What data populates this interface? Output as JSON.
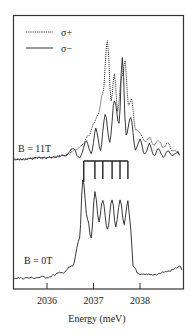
{
  "chart_data": {
    "type": "line",
    "title": "",
    "xlabel": "Energy (meV)",
    "ylabel": "",
    "xlim": [
      2035.27,
      2038.95
    ],
    "x_ticks": [
      2036,
      2037,
      2038
    ],
    "x_tick_labels": [
      "2036",
      "2037",
      "2038"
    ],
    "grid": false,
    "legend": {
      "position": "upper-left",
      "entries": [
        {
          "label": "σ+",
          "style": "dotted"
        },
        {
          "label": "σ−",
          "style": "solid"
        }
      ]
    },
    "annotations": [
      {
        "text": "B = 11T",
        "attached_to": "upper-panel"
      },
      {
        "text": "B = 0T",
        "attached_to": "lower-panel"
      },
      {
        "type": "comb",
        "description": "six vertical marker lines joined by a horizontal bar",
        "x_positions": [
          2036.79,
          2037.03,
          2037.2,
          2037.4,
          2037.57,
          2037.74
        ]
      }
    ],
    "series": [
      {
        "name": "σ+ (B = 11T)",
        "style": "dotted",
        "panel": "upper",
        "x": [
          2035.27,
          2035.6,
          2036.0,
          2036.4,
          2036.6,
          2036.75,
          2036.9,
          2037.0,
          2037.1,
          2037.2,
          2037.3,
          2037.38,
          2037.45,
          2037.52,
          2037.6,
          2037.68,
          2037.75,
          2037.82,
          2037.9,
          2038.0,
          2038.1,
          2038.2,
          2038.3,
          2038.4,
          2038.5,
          2038.6,
          2038.7,
          2038.85
        ],
        "values": [
          0.0,
          0.01,
          0.02,
          0.04,
          0.08,
          0.12,
          0.2,
          0.3,
          0.38,
          0.55,
          1.0,
          0.5,
          0.72,
          0.4,
          0.68,
          0.82,
          0.45,
          0.5,
          0.25,
          0.22,
          0.14,
          0.18,
          0.1,
          0.15,
          0.08,
          0.12,
          0.05,
          0.04
        ]
      },
      {
        "name": "σ− (B = 11T)",
        "style": "solid",
        "panel": "upper",
        "x": [
          2035.27,
          2035.6,
          2036.0,
          2036.4,
          2036.55,
          2036.7,
          2036.85,
          2036.95,
          2037.05,
          2037.15,
          2037.25,
          2037.35,
          2037.45,
          2037.55,
          2037.62,
          2037.7,
          2037.8,
          2037.9,
          2038.0,
          2038.1,
          2038.2,
          2038.3,
          2038.4,
          2038.5,
          2038.6,
          2038.7,
          2038.85
        ],
        "values": [
          0.0,
          0.01,
          0.02,
          0.04,
          0.1,
          0.02,
          0.16,
          0.05,
          0.26,
          0.08,
          0.38,
          0.15,
          0.5,
          0.3,
          0.86,
          0.2,
          0.35,
          0.08,
          0.16,
          0.03,
          0.12,
          0.02,
          0.08,
          0.01,
          0.05,
          0.02,
          0.04
        ]
      },
      {
        "name": "B = 0T",
        "style": "solid",
        "panel": "lower",
        "x": [
          2035.27,
          2035.6,
          2036.0,
          2036.3,
          2036.55,
          2036.7,
          2036.77,
          2036.87,
          2036.95,
          2037.03,
          2037.12,
          2037.2,
          2037.3,
          2037.4,
          2037.48,
          2037.57,
          2037.66,
          2037.74,
          2037.8,
          2037.85,
          2038.0,
          2038.3,
          2038.6,
          2038.9
        ],
        "values": [
          0.0,
          0.0,
          0.01,
          0.05,
          0.12,
          0.4,
          1.0,
          0.6,
          0.4,
          0.88,
          0.58,
          0.8,
          0.5,
          0.8,
          0.52,
          0.8,
          0.55,
          0.78,
          0.5,
          0.12,
          0.03,
          0.02,
          0.04,
          0.08
        ]
      }
    ]
  }
}
